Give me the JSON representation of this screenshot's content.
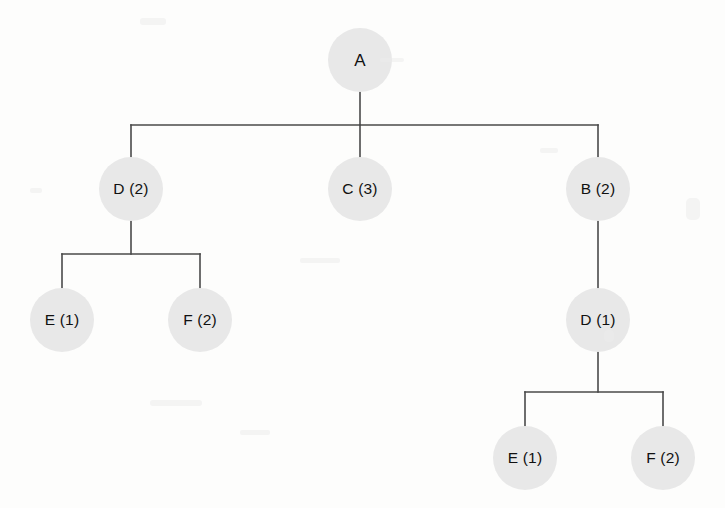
{
  "figure": {
    "type": "tree-diagram",
    "background_color": "#fdfdfc",
    "node_fill_color": "#e8e8e8",
    "edge_color": "#4a4a4a",
    "node_diameter": 64
  },
  "nodes": [
    {
      "id": "n-a",
      "label": "A",
      "cx": 360,
      "cy": 60,
      "level": 1
    },
    {
      "id": "n-d2",
      "label": "D (2)",
      "cx": 131,
      "cy": 189,
      "level": 2
    },
    {
      "id": "n-c3",
      "label": "C (3)",
      "cx": 360,
      "cy": 189,
      "level": 2
    },
    {
      "id": "n-b2",
      "label": "B (2)",
      "cx": 598,
      "cy": 189,
      "level": 2
    },
    {
      "id": "n-e1-left",
      "label": "E (1)",
      "cx": 62,
      "cy": 320,
      "level": 3
    },
    {
      "id": "n-f2-left",
      "label": "F (2)",
      "cx": 200,
      "cy": 320,
      "level": 3
    },
    {
      "id": "n-d1",
      "label": "D (1)",
      "cx": 598,
      "cy": 320,
      "level": 3
    },
    {
      "id": "n-e1-bot",
      "label": "E (1)",
      "cx": 525,
      "cy": 458,
      "level": 4
    },
    {
      "id": "n-f2-bot",
      "label": "F (2)",
      "cx": 663,
      "cy": 458,
      "level": 4
    }
  ],
  "edges": {
    "root_stem": {
      "x": 360,
      "y1": 92,
      "y2": 125
    },
    "level2_bus": {
      "y": 125,
      "x1": 131,
      "x2": 598
    },
    "level2_drops": [
      {
        "x": 131,
        "y1": 125,
        "y2": 157
      },
      {
        "x": 360,
        "y1": 125,
        "y2": 157
      },
      {
        "x": 598,
        "y1": 125,
        "y2": 157
      }
    ],
    "d2_stem": {
      "x": 131,
      "y1": 221,
      "y2": 254
    },
    "d2_bus": {
      "y": 254,
      "x1": 62,
      "x2": 200
    },
    "d2_drops": [
      {
        "x": 62,
        "y1": 254,
        "y2": 288
      },
      {
        "x": 200,
        "y1": 254,
        "y2": 288
      }
    ],
    "b2_to_d1": {
      "x": 598,
      "y1": 221,
      "y2": 288
    },
    "d1_stem": {
      "x": 598,
      "y1": 352,
      "y2": 392
    },
    "d1_bus": {
      "y": 392,
      "x1": 525,
      "x2": 663
    },
    "d1_drops": [
      {
        "x": 525,
        "y1": 392,
        "y2": 426
      },
      {
        "x": 663,
        "y1": 392,
        "y2": 426
      }
    ]
  }
}
